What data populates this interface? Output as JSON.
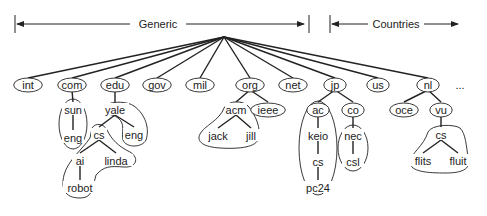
{
  "diagram": {
    "type": "tree",
    "ranges": [
      {
        "label": "Generic",
        "x1": 15,
        "x2": 308
      },
      {
        "label": "Countries",
        "x1": 330,
        "x2": 460
      }
    ],
    "root": {
      "x": 224,
      "y": 37
    },
    "top_level": [
      {
        "id": "int",
        "label": "int",
        "x": 28
      },
      {
        "id": "com",
        "label": "com",
        "x": 72
      },
      {
        "id": "edu",
        "label": "edu",
        "x": 115
      },
      {
        "id": "gov",
        "label": "gov",
        "x": 157
      },
      {
        "id": "mil",
        "label": "mil",
        "x": 200
      },
      {
        "id": "org",
        "label": "org",
        "x": 250
      },
      {
        "id": "net",
        "label": "net",
        "x": 293
      },
      {
        "id": "jp",
        "label": "jp",
        "x": 335
      },
      {
        "id": "us",
        "label": "us",
        "x": 378
      },
      {
        "id": "nl",
        "label": "nl",
        "x": 428
      }
    ],
    "ellipsis": "...",
    "nodes": [
      {
        "id": "sun",
        "label": "sun",
        "x": 73,
        "y": 110
      },
      {
        "id": "sun-eng",
        "label": "eng",
        "x": 73,
        "y": 138
      },
      {
        "id": "yale",
        "label": "yale",
        "x": 115,
        "y": 110
      },
      {
        "id": "yale-cs",
        "label": "cs",
        "x": 99,
        "y": 135
      },
      {
        "id": "yale-eng",
        "label": "eng",
        "x": 134,
        "y": 135
      },
      {
        "id": "ai",
        "label": "ai",
        "x": 80,
        "y": 161
      },
      {
        "id": "linda",
        "label": "linda",
        "x": 116,
        "y": 161
      },
      {
        "id": "robot",
        "label": "robot",
        "x": 80,
        "y": 188
      },
      {
        "id": "acm",
        "label": "acm",
        "x": 236,
        "y": 110
      },
      {
        "id": "ieee",
        "label": "ieee",
        "x": 268,
        "y": 110
      },
      {
        "id": "jack",
        "label": "jack",
        "x": 218,
        "y": 136
      },
      {
        "id": "jill",
        "label": "jill",
        "x": 251,
        "y": 136
      },
      {
        "id": "ac",
        "label": "ac",
        "x": 318,
        "y": 110
      },
      {
        "id": "co",
        "label": "co",
        "x": 353,
        "y": 110
      },
      {
        "id": "keio",
        "label": "keio",
        "x": 318,
        "y": 136
      },
      {
        "id": "keio-cs",
        "label": "cs",
        "x": 318,
        "y": 162
      },
      {
        "id": "pc24",
        "label": "pc24",
        "x": 318,
        "y": 188
      },
      {
        "id": "nec",
        "label": "nec",
        "x": 353,
        "y": 136
      },
      {
        "id": "csl",
        "label": "csl",
        "x": 353,
        "y": 162
      },
      {
        "id": "oce",
        "label": "oce",
        "x": 404,
        "y": 110
      },
      {
        "id": "vu",
        "label": "vu",
        "x": 441,
        "y": 110
      },
      {
        "id": "vu-cs",
        "label": "cs",
        "x": 441,
        "y": 135
      },
      {
        "id": "flits",
        "label": "flits",
        "x": 423,
        "y": 161
      },
      {
        "id": "fluit",
        "label": "fluit",
        "x": 458,
        "y": 161
      }
    ],
    "edges": [
      [
        "com",
        "sun"
      ],
      [
        "sun",
        "sun-eng"
      ],
      [
        "edu",
        "yale"
      ],
      [
        "yale",
        "yale-cs"
      ],
      [
        "yale",
        "yale-eng"
      ],
      [
        "yale-cs",
        "ai"
      ],
      [
        "yale-cs",
        "linda"
      ],
      [
        "ai",
        "robot"
      ],
      [
        "org",
        "acm"
      ],
      [
        "org",
        "ieee"
      ],
      [
        "acm",
        "jack"
      ],
      [
        "acm",
        "jill"
      ],
      [
        "jp",
        "ac"
      ],
      [
        "jp",
        "co"
      ],
      [
        "ac",
        "keio"
      ],
      [
        "keio",
        "keio-cs"
      ],
      [
        "keio-cs",
        "pc24"
      ],
      [
        "co",
        "nec"
      ],
      [
        "nec",
        "csl"
      ],
      [
        "nl",
        "oce"
      ],
      [
        "nl",
        "vu"
      ],
      [
        "vu",
        "vu-cs"
      ],
      [
        "vu-cs",
        "flits"
      ],
      [
        "vu-cs",
        "fluit"
      ]
    ]
  }
}
